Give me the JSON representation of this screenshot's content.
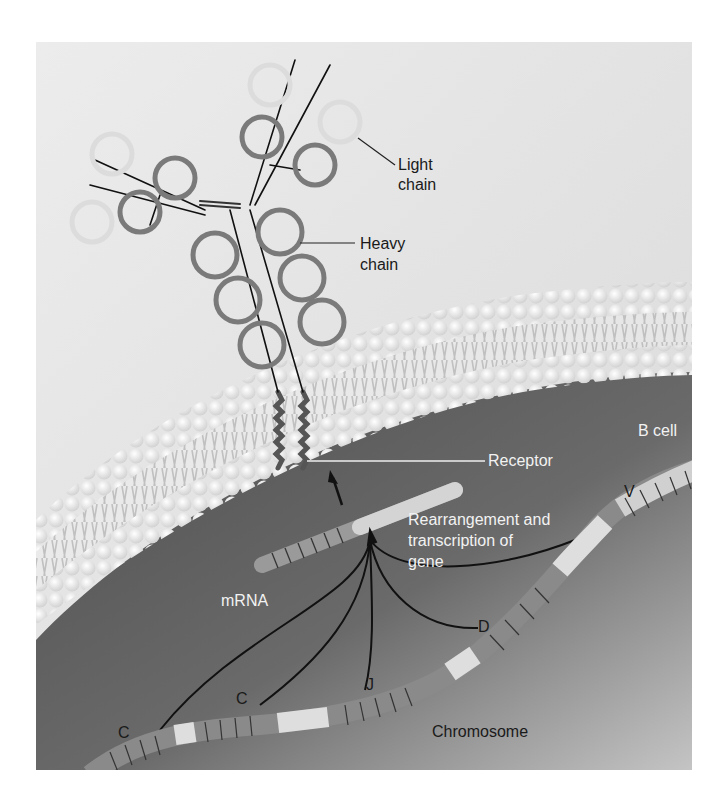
{
  "figure": {
    "colors": {
      "background_upper": "#e6e6e6",
      "cell_interior": "#5e5e5e",
      "membrane_head": "#f4f4f4",
      "heavy_chain": "#7a7a7a",
      "light_chain": "#e2e2e2",
      "chromosome_dark": "#8a8a8a",
      "chromosome_light": "#dedede"
    }
  },
  "labels": {
    "light_chain_line1": "Light",
    "light_chain_line2": "chain",
    "heavy_chain_line1": "Heavy",
    "heavy_chain_line2": "chain",
    "b_cell": "B cell",
    "receptor": "Receptor",
    "rearrangement_line1": "Rearrangement and",
    "rearrangement_line2": "transcription of",
    "rearrangement_line3": "gene",
    "mrna": "mRNA",
    "chromosome": "Chromosome",
    "segment_v": "V",
    "segment_d": "D",
    "segment_j": "J",
    "segment_c1": "C",
    "segment_c2": "C"
  }
}
